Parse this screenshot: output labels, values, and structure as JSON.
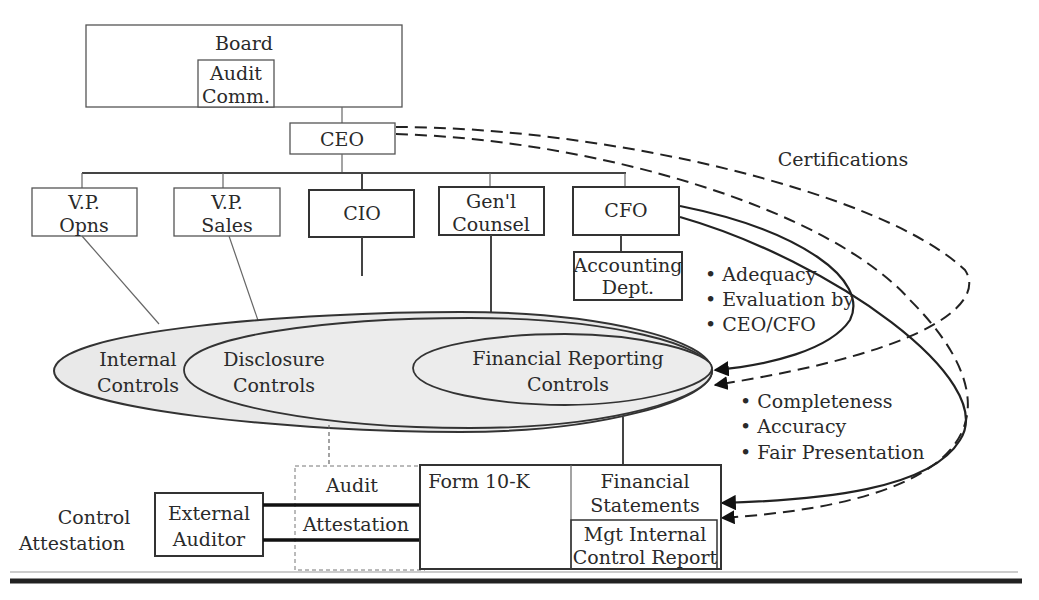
{
  "diagram": {
    "type": "organizational control diagram",
    "board": {
      "label": "Board",
      "sub": {
        "line1": "Audit",
        "line2": "Comm."
      }
    },
    "ceo": {
      "label": "CEO"
    },
    "officers": [
      {
        "line1": "V.P.",
        "line2": "Opns"
      },
      {
        "line1": "V.P.",
        "line2": "Sales"
      },
      {
        "line1": "CIO",
        "line2": ""
      },
      {
        "line1": "Gen'l",
        "line2": "Counsel"
      },
      {
        "line1": "CFO",
        "line2": ""
      }
    ],
    "accounting": {
      "line1": "Accounting",
      "line2": "Dept."
    },
    "certifications": {
      "label": "Certifications"
    },
    "evaluation_bullets": [
      "Adequacy",
      "Evaluation by",
      "CEO/CFO"
    ],
    "controls": {
      "internal": {
        "line1": "Internal",
        "line2": "Controls"
      },
      "disclosure": {
        "line1": "Disclosure",
        "line2": "Controls"
      },
      "financial_reporting": {
        "line1": "Financial Reporting",
        "line2": "Controls"
      }
    },
    "quality_bullets": [
      "Completeness",
      "Accuracy",
      "Fair Presentation"
    ],
    "bottom": {
      "control_attestation": {
        "line1": "Control",
        "line2": "Attestation"
      },
      "external_auditor": {
        "line1": "External",
        "line2": "Auditor"
      },
      "audit_label": "Audit",
      "attestation_label": "Attestation",
      "form_label": "Form 10-K",
      "financial_statements": {
        "line1": "Financial",
        "line2": "Statements"
      },
      "mgt_report": {
        "line1": "Mgt Internal",
        "line2": "Control Report"
      }
    },
    "colors": {
      "ellipse_fill": "#e9e9e9",
      "line": "#222222"
    }
  }
}
